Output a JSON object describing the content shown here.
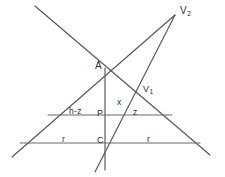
{
  "figure": {
    "kind": "geometric-construction",
    "background_color": "#ffffff",
    "line_color": "#55565a",
    "label_color": "#2e2f33",
    "width": 225,
    "height": 177
  },
  "points": {
    "v2": {
      "label": "V",
      "subscript": "2",
      "x": 175,
      "y": 15
    },
    "v1": {
      "label": "V",
      "subscript": "1",
      "x": 140,
      "y": 90
    },
    "a": {
      "label": "A",
      "x": 105,
      "y": 70
    },
    "p": {
      "label": "P",
      "x": 105,
      "y": 115
    },
    "c": {
      "label": "C",
      "x": 105,
      "y": 143
    }
  },
  "segment_labels": {
    "x": "x",
    "h_minus_z": "h-z",
    "z": "z",
    "r_left": "r",
    "r_right": "r"
  },
  "lines": [
    {
      "name": "line-upperleft-through-a-to-lowerright",
      "from": [
        35,
        6
      ],
      "to": [
        210,
        155
      ]
    },
    {
      "name": "line-lowerleft-through-a-to-v2",
      "from": [
        12,
        157
      ],
      "to": [
        175,
        15
      ]
    },
    {
      "name": "line-lowerleft-through-c-v1-to-v2",
      "from": [
        95,
        172
      ],
      "to": [
        175,
        15
      ]
    },
    {
      "name": "vertical-axis-a-p-c",
      "from": [
        105,
        68
      ],
      "to": [
        105,
        170
      ]
    },
    {
      "name": "horizontal-chord-middle",
      "from": [
        48,
        115
      ],
      "to": [
        172,
        115
      ]
    },
    {
      "name": "horizontal-chord-bottom",
      "from": [
        20,
        143
      ],
      "to": [
        200,
        143
      ]
    }
  ]
}
